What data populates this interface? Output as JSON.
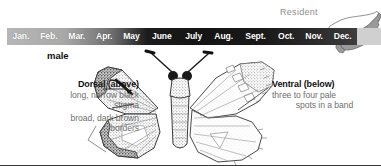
{
  "plate": {
    "species_sex_label": "male",
    "bottom_rule_color": "#3a3a3a",
    "background": "#ffffff"
  },
  "range": {
    "status_label": "Resident",
    "status_color": "#8e8e8e",
    "map_name": "north-carolina",
    "shaded_region_color": "#9a9a9a",
    "unshaded_region_color": "#ffffff",
    "outline_color": "#555555"
  },
  "flight_bar": {
    "months": [
      {
        "label": "Jan.",
        "abundance": "none"
      },
      {
        "label": "Feb.",
        "abundance": "none"
      },
      {
        "label": "Mar.",
        "abundance": "low"
      },
      {
        "label": "Apr.",
        "abundance": "medium"
      },
      {
        "label": "May",
        "abundance": "high"
      },
      {
        "label": "June",
        "abundance": "high"
      },
      {
        "label": "July",
        "abundance": "high"
      },
      {
        "label": "Aug.",
        "abundance": "high"
      },
      {
        "label": "Sept.",
        "abundance": "high"
      },
      {
        "label": "Oct.",
        "abundance": "high"
      },
      {
        "label": "Nov.",
        "abundance": "medium"
      },
      {
        "label": "Dec.",
        "abundance": "medium"
      }
    ],
    "text_color": "#ffffff",
    "gradient_start_color": "#b6b6b6",
    "gradient_end_color": "#141414"
  },
  "annotations": {
    "dorsal": {
      "heading": "Dorsal (above)",
      "lines": [
        "long, narrow black",
        "stigma",
        "broad, dark brown",
        "borders"
      ]
    },
    "ventral": {
      "heading": "Ventral (below)",
      "lines": [
        "three to four pale",
        "spots in a band"
      ]
    }
  }
}
